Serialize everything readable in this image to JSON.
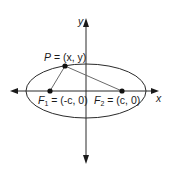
{
  "diagram": {
    "type": "ellipse-foci",
    "axes": {
      "x_label": "x",
      "y_label": "y"
    },
    "point_P": {
      "name": "P",
      "label": "P = (x, y)",
      "eq": " = (x, y)"
    },
    "focus_1": {
      "name": "F",
      "sub": "1",
      "eq": " = (-c, 0)"
    },
    "focus_2": {
      "name": "F",
      "sub": "2",
      "eq": " = (c, 0)"
    },
    "colors": {
      "stroke": "#2a2a2a",
      "segment": "#6a6a6a",
      "background": "#ffffff"
    }
  }
}
